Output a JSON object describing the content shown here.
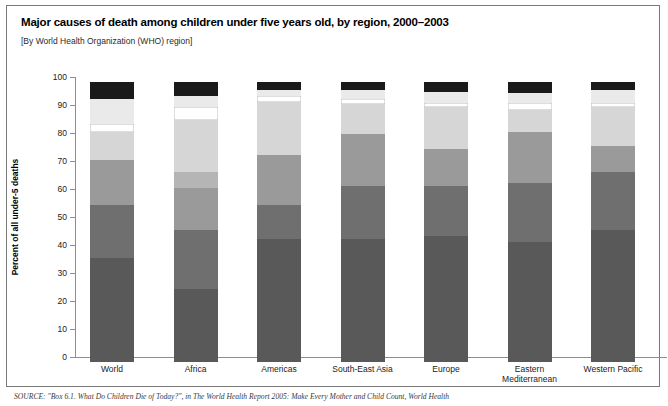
{
  "header": {
    "title": "Major causes of death among children under five years old, by region, 2000–2003",
    "subtitle": "[By World Health Organization (WHO) region]"
  },
  "source": {
    "text": "SOURCE: \"Box 6.1. What Do Children Die of Today?\", in The World Health Report 2005: Make Every Mother and Child Count, World Health"
  },
  "chart_data": {
    "type": "bar",
    "stacked": true,
    "title": "Major causes of death among children under five years old, by region, 2000–2003",
    "subtitle": "[By World Health Organization (WHO) region]",
    "xlabel": "",
    "ylabel": "Percent of all under-5 deaths",
    "ylim": [
      0,
      100
    ],
    "yticks": [
      0,
      10,
      20,
      30,
      40,
      50,
      60,
      70,
      80,
      90,
      100
    ],
    "grid": false,
    "legend": "none",
    "categories": [
      "World",
      "Africa",
      "Americas",
      "South-East Asia",
      "Europe",
      "Eastern Mediterranean",
      "Western Pacific"
    ],
    "category_label_lines": [
      [
        "World"
      ],
      [
        "Africa"
      ],
      [
        "Americas"
      ],
      [
        "South-East Asia"
      ],
      [
        "Europe"
      ],
      [
        "Eastern",
        "Mediterranean"
      ],
      [
        "Western Pacific"
      ]
    ],
    "series": [
      {
        "name": "segment-1",
        "color": "#595959",
        "values": [
          37,
          26,
          44,
          44,
          45,
          43,
          47
        ]
      },
      {
        "name": "segment-2",
        "color": "#6f6f6f",
        "values": [
          19,
          21,
          12,
          19,
          18,
          21,
          21
        ]
      },
      {
        "name": "segment-3",
        "color": "#9a9a9a",
        "values": [
          16,
          15,
          18,
          18.5,
          13,
          18,
          9
        ]
      },
      {
        "name": "segment-4",
        "color": "#b5b5b5",
        "values": [
          0,
          6,
          0,
          0,
          0,
          0,
          0
        ]
      },
      {
        "name": "segment-5",
        "color": "#d6d6d6",
        "values": [
          10,
          18.5,
          19,
          10.5,
          15,
          8,
          14
        ]
      },
      {
        "name": "segment-6",
        "color": "#ffffff",
        "values": [
          3,
          4.5,
          2,
          2,
          1.5,
          2.5,
          1.5
        ]
      },
      {
        "name": "segment-7",
        "color": "#eaeaea",
        "values": [
          9,
          4,
          2,
          3,
          4,
          3.5,
          4.5
        ]
      },
      {
        "name": "segment-8",
        "color": "#1a1a1a",
        "values": [
          6,
          5,
          3,
          3,
          3.5,
          4,
          3
        ]
      }
    ],
    "axis_colors": {
      "axis_line": "#8d8d8d",
      "text": "#1b1b1b"
    }
  }
}
